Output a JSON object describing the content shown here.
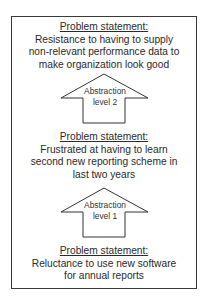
{
  "statements": [
    {
      "heading": "Problem statement:",
      "lines": [
        "Resistance to having to supply",
        "non-relevant performance data to",
        "make organization look good"
      ]
    },
    {
      "heading": "Problem statement:",
      "lines": [
        "Frustrated at having to learn",
        "second new reporting scheme in",
        "last two years"
      ]
    },
    {
      "heading": "Problem statement:",
      "lines": [
        "Reluctance to use new software",
        "for annual reports"
      ]
    }
  ],
  "arrows": [
    {
      "label_line1": "Abstraction",
      "label_line2": "level 2"
    },
    {
      "label_line1": "Abstraction",
      "label_line2": "level 1"
    }
  ]
}
